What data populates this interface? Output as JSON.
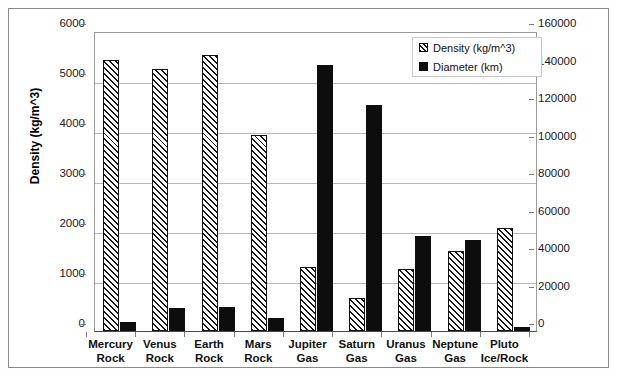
{
  "chart_data": {
    "type": "bar",
    "title": "",
    "xlabel": "",
    "grid": true,
    "legend_position": "top-right",
    "categories": [
      "Mercury Rock",
      "Venus Rock",
      "Earth Rock",
      "Mars Rock",
      "Jupiter Gas",
      "Saturn Gas",
      "Uranus Gas",
      "Neptune Gas",
      "Pluto Ice/Rock"
    ],
    "category_lines": [
      [
        "Mercury",
        "Rock"
      ],
      [
        "Venus",
        "Rock"
      ],
      [
        "Earth",
        "Rock"
      ],
      [
        "Mars",
        "Rock"
      ],
      [
        "Jupiter",
        "Gas"
      ],
      [
        "Saturn",
        "Gas"
      ],
      [
        "Uranus",
        "Gas"
      ],
      [
        "Neptune",
        "Gas"
      ],
      [
        "Pluto",
        "Ice/Rock"
      ]
    ],
    "series": [
      {
        "name": "Density (kg/m^3)",
        "axis": "left",
        "color": "#ffffff",
        "pattern": "diagonal-hatch",
        "values": [
          5430,
          5240,
          5520,
          3920,
          1290,
          660,
          1240,
          1600,
          2060
        ]
      },
      {
        "name": "Diameter (km)",
        "axis": "right",
        "color": "#0d0d0d",
        "pattern": "solid",
        "values": [
          4900,
          12100,
          12750,
          6780,
          142000,
          120500,
          50700,
          48500,
          2300
        ]
      }
    ],
    "left_axis": {
      "title": "Density (kg/m^3)",
      "min": 0,
      "max": 6000,
      "step": 1000,
      "ticks": [
        "0",
        "1000",
        "2000",
        "3000",
        "4000",
        "5000",
        "6000"
      ]
    },
    "right_axis": {
      "title": "Diameter (km)",
      "min": 0,
      "max": 160000,
      "step": 20000,
      "ticks": [
        "0",
        "20000",
        "40000",
        "60000",
        "80000",
        "100000",
        "120000",
        "140000",
        "160000"
      ]
    }
  },
  "legend": {
    "items": [
      {
        "label": "Density (kg/m^3)"
      },
      {
        "label": "Diameter (km)"
      }
    ]
  },
  "colors": {
    "background": "#ffffff",
    "frame": "#8a8a8a",
    "grid": "#b8b8b8",
    "axis": "#4a4a4a",
    "diameter_bar": "#0d0d0d",
    "text": "#111111"
  }
}
